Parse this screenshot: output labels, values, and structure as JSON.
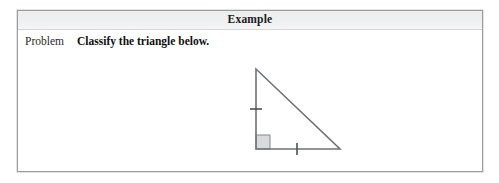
{
  "box": {
    "header_title": "Example",
    "border_color": "#9d9d9d",
    "header_bg": "#eeeff0"
  },
  "problem": {
    "label": "Problem",
    "statement": "Classify the triangle below."
  },
  "figure": {
    "caption": "",
    "shape_name": "right-isosceles-triangle",
    "stroke_color": "#6f7276",
    "right_angle_fill": "#d9dadb",
    "vertices": {
      "apex": [
        49,
        17
      ],
      "right_angle": [
        49,
        97
      ],
      "bottom_right": [
        133,
        97
      ]
    },
    "tick_marks": [
      {
        "side": "vertical-leg",
        "count": 1
      },
      {
        "side": "horizontal-leg",
        "count": 1
      }
    ],
    "right_angle_marker": true
  }
}
